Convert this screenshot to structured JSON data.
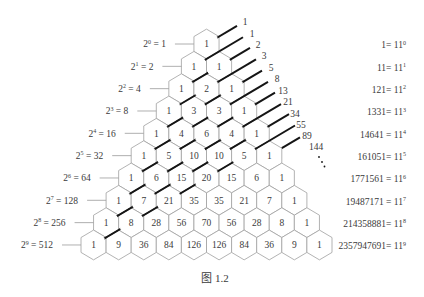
{
  "figure": {
    "caption": "图 1.2",
    "pascal_rows": [
      [
        1
      ],
      [
        1,
        1
      ],
      [
        1,
        2,
        1
      ],
      [
        1,
        3,
        3,
        1
      ],
      [
        1,
        4,
        6,
        4,
        1
      ],
      [
        1,
        5,
        10,
        10,
        5,
        1
      ],
      [
        1,
        6,
        15,
        20,
        15,
        6,
        1
      ],
      [
        1,
        7,
        21,
        35,
        35,
        21,
        7,
        1
      ],
      [
        1,
        8,
        28,
        56,
        70,
        56,
        28,
        8,
        1
      ],
      [
        1,
        9,
        36,
        84,
        126,
        126,
        84,
        36,
        9,
        1
      ]
    ],
    "left_labels": [
      {
        "base": "2",
        "exponent": "0",
        "equals": " = ",
        "value": "1"
      },
      {
        "base": "2",
        "exponent": "1",
        "equals": " = ",
        "value": "2"
      },
      {
        "base": "2",
        "exponent": "2",
        "equals": " = ",
        "value": "4"
      },
      {
        "base": "2",
        "exponent": "3",
        "equals": " = ",
        "value": "8"
      },
      {
        "base": "2",
        "exponent": "4",
        "equals": " = ",
        "value": "16"
      },
      {
        "base": "2",
        "exponent": "5",
        "equals": " = ",
        "value": "32"
      },
      {
        "base": "2",
        "exponent": "6",
        "equals": " = ",
        "value": "64"
      },
      {
        "base": "2",
        "exponent": "7",
        "equals": " = ",
        "value": "128"
      },
      {
        "base": "2",
        "exponent": "8",
        "equals": " = ",
        "value": "256"
      },
      {
        "base": "2",
        "exponent": "9",
        "equals": " = ",
        "value": "512"
      }
    ],
    "right_labels": [
      {
        "value": "1",
        "equals": "= ",
        "base": "11",
        "exponent": "0"
      },
      {
        "value": "11",
        "equals": "= ",
        "base": "11",
        "exponent": "1"
      },
      {
        "value": "121",
        "equals": "= ",
        "base": "11",
        "exponent": "2"
      },
      {
        "value": "1331",
        "equals": "= ",
        "base": "11",
        "exponent": "3"
      },
      {
        "value": "14641",
        "equals": " = ",
        "base": "11",
        "exponent": "4"
      },
      {
        "value": "161051",
        "equals": "= ",
        "base": "11",
        "exponent": "5"
      },
      {
        "value": "1771561",
        "equals": " = ",
        "base": "11",
        "exponent": "6"
      },
      {
        "value": "19487171",
        "equals": " = ",
        "base": "11",
        "exponent": "7"
      },
      {
        "value": "214358881",
        "equals": "= ",
        "base": "11",
        "exponent": "8"
      },
      {
        "value": "2357947691",
        "equals": "= ",
        "base": "11",
        "exponent": "9"
      }
    ],
    "fibonacci": [
      "1",
      "1",
      "2",
      "3",
      "5",
      "8",
      "13",
      "21",
      "34",
      "55",
      "89",
      "144"
    ],
    "continuation_dots": ".",
    "diagonal_line_count": 11
  },
  "colors": {
    "background": "#ffffff",
    "hex_fill": "#ffffff",
    "hex_stroke": "#a0a0a0",
    "diagonal_line": "#151515",
    "text": "#3a3a3a",
    "label_line": "#9a9a9a"
  }
}
